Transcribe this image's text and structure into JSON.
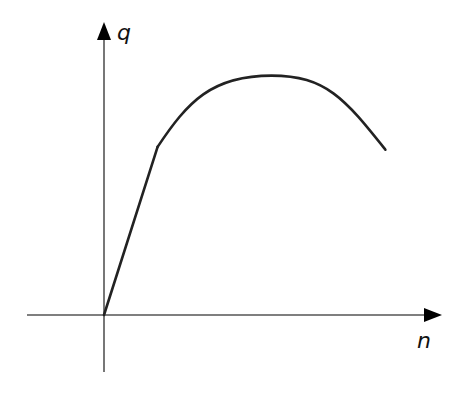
{
  "diagram": {
    "type": "line",
    "x_axis_label": "n",
    "y_axis_label": "q",
    "colors": {
      "curve": "#222222",
      "axis": "#555555",
      "arrow": "#000000",
      "background": "#ffffff"
    }
  },
  "chart_data": {
    "type": "line",
    "title": "",
    "xlabel": "n",
    "ylabel": "q",
    "ticks": "none",
    "grid": false,
    "legend": "none",
    "series": [
      {
        "name": "q(n)",
        "segments": [
          {
            "kind": "linear",
            "from": [
              0,
              0
            ],
            "to": [
              0.16,
              0.59
            ]
          },
          {
            "kind": "curve",
            "through": [
              [
                0.16,
                0.59
              ],
              [
                0.5,
                0.84
              ],
              [
                0.84,
                0.58
              ]
            ],
            "peak": [
              0.5,
              0.84
            ]
          }
        ]
      }
    ],
    "x_range": [
      -0.23,
      1.0
    ],
    "y_range": [
      -0.25,
      1.0
    ]
  }
}
